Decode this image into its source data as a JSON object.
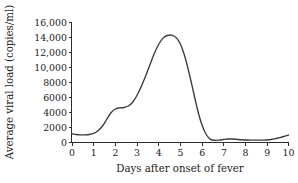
{
  "chart_data": {
    "type": "line",
    "title": "",
    "subtitle": "",
    "xlabel": "Days after onset of fever",
    "ylabel": "Average viral load (copies/ml)",
    "xlim": [
      0,
      10
    ],
    "ylim": [
      0,
      16000
    ],
    "grid": false,
    "legend": false,
    "legend_position": "none",
    "line_color": "#3a3a3a",
    "background_color": "#ffffff",
    "x_ticks": [
      0,
      1,
      2,
      3,
      4,
      5,
      6,
      7,
      8,
      9,
      10
    ],
    "x_tick_labels": [
      "0",
      "1",
      "2",
      "3",
      "4",
      "5",
      "6",
      "7",
      "8",
      "9",
      "10"
    ],
    "y_ticks": [
      0,
      2000,
      4000,
      6000,
      8000,
      10000,
      12000,
      14000,
      16000
    ],
    "y_tick_labels": [
      "0",
      "2000",
      "4000",
      "6000",
      "8000",
      "10,000",
      "12,000",
      "14,000",
      "16,000"
    ],
    "series": [
      {
        "name": "Average viral load",
        "x": [
          0.0,
          0.2,
          0.4,
          0.6,
          0.8,
          1.0,
          1.2,
          1.4,
          1.6,
          1.8,
          2.0,
          2.2,
          2.4,
          2.6,
          2.8,
          3.0,
          3.2,
          3.4,
          3.6,
          3.8,
          4.0,
          4.2,
          4.4,
          4.6,
          4.8,
          5.0,
          5.2,
          5.4,
          5.6,
          5.8,
          6.0,
          6.2,
          6.4,
          6.6,
          6.8,
          7.0,
          7.2,
          7.4,
          7.6,
          7.8,
          8.0,
          8.2,
          8.4,
          8.6,
          8.8,
          9.0,
          9.2,
          9.4,
          9.6,
          9.8,
          10.0
        ],
        "y": [
          1100,
          1000,
          950,
          950,
          1000,
          1150,
          1500,
          2100,
          3000,
          3900,
          4400,
          4550,
          4600,
          4800,
          5300,
          6200,
          7400,
          8800,
          10300,
          11800,
          13000,
          13850,
          14200,
          14250,
          13950,
          13100,
          11500,
          9300,
          6800,
          4300,
          2300,
          1000,
          350,
          230,
          250,
          330,
          400,
          400,
          360,
          300,
          270,
          260,
          250,
          250,
          250,
          270,
          330,
          440,
          590,
          760,
          930
        ]
      }
    ],
    "annotations": [],
    "peak": {
      "x": 4.6,
      "y": 14250
    }
  }
}
